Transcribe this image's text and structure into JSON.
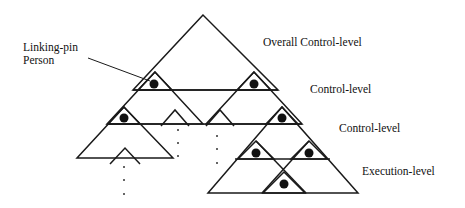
{
  "labels": {
    "linking_pin_line1": "Linking-pin",
    "linking_pin_line2": "Person",
    "overall_control_level": "Overall Control-level",
    "control_level_1": "Control-level",
    "control_level_2": "Control-level",
    "execution_level": "Execution-level"
  },
  "colors": {
    "stroke": "#1a1a1a",
    "pin": "#111111",
    "background": "#ffffff"
  }
}
